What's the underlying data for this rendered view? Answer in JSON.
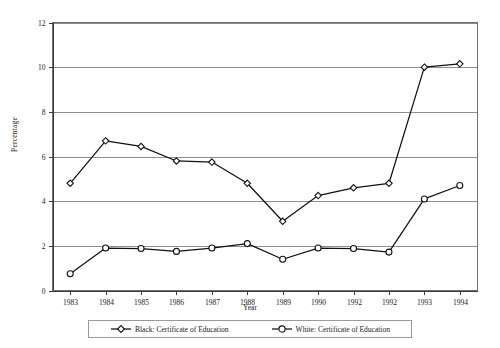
{
  "chart_data": {
    "type": "line",
    "title": "",
    "xlabel": "Year",
    "ylabel": "Percentage",
    "categories": [
      "1983",
      "1984",
      "1985",
      "1986",
      "1987",
      "1988",
      "1989",
      "1990",
      "1992",
      "1992",
      "1993",
      "1994"
    ],
    "ylim": [
      0,
      12
    ],
    "yticks": [
      0,
      2,
      4,
      6,
      8,
      10,
      12
    ],
    "ytick_labels": [
      "0",
      "2",
      "4",
      "6",
      "8",
      "10",
      "12"
    ],
    "grid": true,
    "legend_position": "bottom",
    "series": [
      {
        "name": "Black: Certificate of Education",
        "marker": "diamond",
        "color": "#111111",
        "values": [
          4.8,
          6.7,
          6.45,
          5.8,
          5.75,
          4.8,
          3.1,
          4.25,
          4.6,
          4.8,
          10.0,
          10.15
        ]
      },
      {
        "name": "White: Certificate of Education",
        "marker": "circle",
        "color": "#111111",
        "values": [
          0.75,
          1.9,
          1.88,
          1.75,
          1.9,
          2.1,
          1.4,
          1.9,
          1.88,
          1.72,
          4.1,
          4.7
        ]
      }
    ]
  },
  "legend": {
    "entries": [
      {
        "label": "Black: Certificate of Education",
        "marker": "diamond"
      },
      {
        "label": "White: Certificate of Education",
        "marker": "circle"
      }
    ]
  }
}
